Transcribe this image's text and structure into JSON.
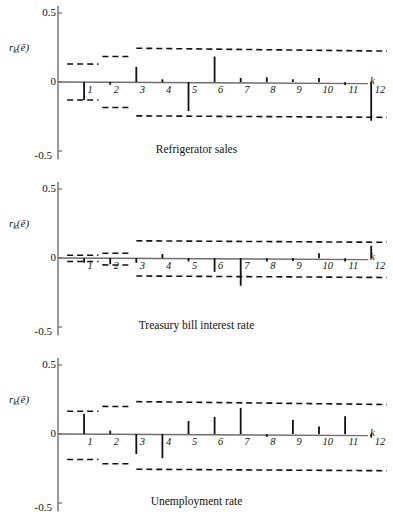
{
  "figure": {
    "y_axis_label": "r",
    "y_axis_label_sub": "k",
    "y_axis_label_arg": "(ê)",
    "x_axis_label": "k",
    "y_ticks": [
      "0.5",
      "0",
      "-0.5"
    ],
    "k_ticks": [
      "1",
      "2",
      "3",
      "4",
      "5",
      "6",
      "7",
      "8",
      "9",
      "10",
      "11",
      "12"
    ],
    "line_color": "#111111",
    "axis_color": "#6e6e6e",
    "band_color": "#111111"
  },
  "chart_data": [
    {
      "type": "bar",
      "title": "Refrigerator sales",
      "xlabel": "k",
      "ylabel": "r_k(ê)",
      "ylim": [
        -0.5,
        0.5
      ],
      "yticks": [
        0.5,
        0,
        -0.5
      ],
      "grid": false,
      "legend": "none",
      "categories": [
        1,
        2,
        3,
        4,
        5,
        6,
        7,
        8,
        9,
        10,
        11,
        12
      ],
      "values": [
        -0.13,
        -0.02,
        0.11,
        0.02,
        -0.21,
        0.185,
        0.03,
        0.035,
        0.02,
        0.03,
        -0.02,
        -0.28
      ],
      "bands": {
        "note": "dashed two-standard-error limits, widening in steps",
        "upper": [
          {
            "from_k": 0.35,
            "to_k": 1.55,
            "y": 0.13
          },
          {
            "from_k": 1.7,
            "to_k": 2.75,
            "y": 0.185
          },
          {
            "from_k": 3.0,
            "to_k": 12.6,
            "y_start": 0.245,
            "y_end": 0.225
          }
        ],
        "lower": [
          {
            "from_k": 0.35,
            "to_k": 1.55,
            "y": -0.13
          },
          {
            "from_k": 1.7,
            "to_k": 2.75,
            "y": -0.185
          },
          {
            "from_k": 3.0,
            "to_k": 12.6,
            "y_start": -0.245,
            "y_end": -0.255
          }
        ]
      }
    },
    {
      "type": "bar",
      "title": "Treasury bill interest rate",
      "xlabel": "k",
      "ylabel": "r_k(ê)",
      "ylim": [
        -0.5,
        0.5
      ],
      "yticks": [
        0.5,
        0,
        -0.5
      ],
      "grid": false,
      "legend": "none",
      "categories": [
        1,
        2,
        3,
        4,
        5,
        6,
        7,
        8,
        9,
        10,
        11,
        12
      ],
      "values": [
        -0.035,
        -0.045,
        -0.035,
        0.03,
        -0.025,
        -0.1,
        -0.2,
        -0.025,
        -0.02,
        0.035,
        -0.025,
        0.09
      ],
      "bands": {
        "note": "dashed two-standard-error limits, widening in steps",
        "upper": [
          {
            "from_k": 0.35,
            "to_k": 1.55,
            "y": 0.02
          },
          {
            "from_k": 1.7,
            "to_k": 2.75,
            "y": 0.035
          },
          {
            "from_k": 3.0,
            "to_k": 12.6,
            "y_start": 0.125,
            "y_end": 0.115
          }
        ],
        "lower": [
          {
            "from_k": 0.35,
            "to_k": 1.55,
            "y": -0.025
          },
          {
            "from_k": 1.7,
            "to_k": 2.75,
            "y": -0.05
          },
          {
            "from_k": 3.0,
            "to_k": 12.6,
            "y_start": -0.13,
            "y_end": -0.14
          }
        ]
      }
    },
    {
      "type": "bar",
      "title": "Unemployment rate",
      "xlabel": "k",
      "ylabel": "r_k(ê)",
      "ylim": [
        -0.5,
        0.5
      ],
      "yticks": [
        0.5,
        0,
        -0.5
      ],
      "grid": false,
      "legend": "none",
      "categories": [
        1,
        2,
        3,
        4,
        5,
        6,
        7,
        8,
        9,
        10,
        11,
        12
      ],
      "values": [
        0.147,
        0.025,
        -0.145,
        -0.175,
        0.095,
        0.125,
        0.19,
        -0.02,
        0.105,
        0.055,
        0.13,
        -0.025
      ],
      "bands": {
        "note": "dashed two-standard-error limits, widening in steps",
        "upper": [
          {
            "from_k": 0.35,
            "to_k": 1.55,
            "y": 0.165
          },
          {
            "from_k": 1.7,
            "to_k": 2.75,
            "y": 0.2
          },
          {
            "from_k": 3.0,
            "to_k": 12.6,
            "y_start": 0.235,
            "y_end": 0.215
          }
        ],
        "lower": [
          {
            "from_k": 0.35,
            "to_k": 1.55,
            "y": -0.185
          },
          {
            "from_k": 1.7,
            "to_k": 2.75,
            "y": -0.215
          },
          {
            "from_k": 3.0,
            "to_k": 12.6,
            "y_start": -0.255,
            "y_end": -0.265
          }
        ]
      }
    }
  ]
}
